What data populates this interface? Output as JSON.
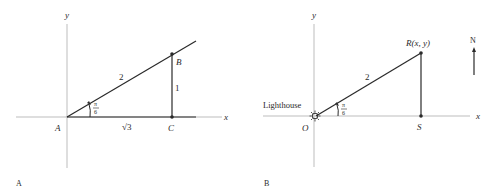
{
  "figure_a": {
    "caption": "A",
    "axis_x_label": "x",
    "axis_y_label": "y",
    "points": {
      "A": "A",
      "B": "B",
      "C": "C"
    },
    "hypotenuse_label": "2",
    "vertical_label": "1",
    "base_label": "√3",
    "angle_num": "π",
    "angle_den": "6"
  },
  "figure_b": {
    "caption": "B",
    "axis_x_label": "x",
    "axis_y_label": "y",
    "origin_label": "O",
    "point_r_label": "R(x, y)",
    "point_s_label": "S",
    "lighthouse_label": "Lighthouse",
    "distance_label": "2",
    "angle_num": "π",
    "angle_den": "6",
    "north_label": "N"
  },
  "colors": {
    "axis": "#b8b8b8",
    "line": "#2a2a2a",
    "text": "#2a2a2a"
  }
}
